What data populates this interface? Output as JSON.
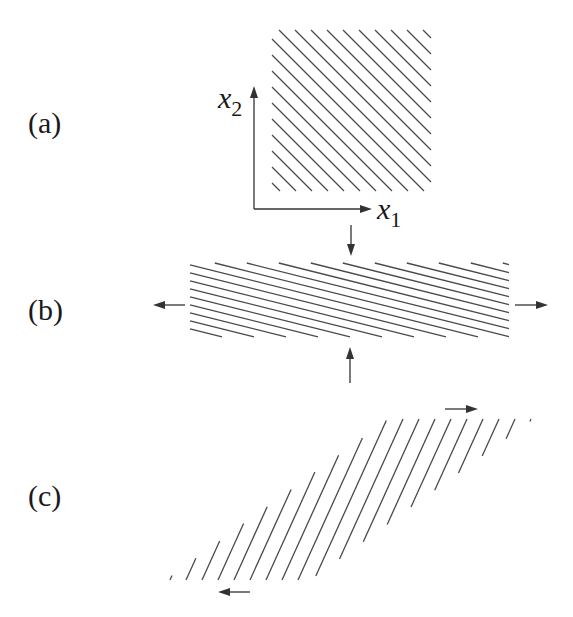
{
  "figure": {
    "panels": [
      {
        "id": "a",
        "label": "(a)",
        "description": "Square region with diagonal hatching and coordinate axes"
      },
      {
        "id": "b",
        "label": "(b)",
        "description": "Region stretched horizontally and compressed vertically"
      },
      {
        "id": "c",
        "label": "(c)",
        "description": "Region sheared into a parallelogram"
      }
    ],
    "axes": {
      "x_label": "x",
      "x_sub": "1",
      "y_label": "x",
      "y_sub": "2"
    },
    "colors": {
      "line": "#4a4a4a",
      "axis": "#333333",
      "text": "#1a1a1a",
      "background": "#ffffff"
    },
    "geometry": {
      "a": {
        "x0": 272,
        "y0": 30,
        "x1": 431,
        "y1": 191,
        "spacing": 16
      },
      "b": {
        "x0": 190,
        "x1": 509,
        "y_top": 263,
        "rows": 10,
        "row_gap": 8.2,
        "seg_len": 32,
        "drop": 8
      },
      "c": {
        "y_top": 419,
        "y_bot": 580,
        "bl_x": 166,
        "tl_x": 389,
        "tr_x": 533,
        "br_x": 310,
        "spacing": 16
      }
    }
  }
}
